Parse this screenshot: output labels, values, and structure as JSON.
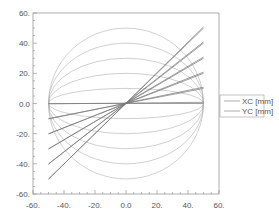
{
  "chart_data": {
    "type": "line",
    "title": "",
    "xlabel": "",
    "ylabel": "",
    "xlim": [
      -60,
      60
    ],
    "ylim": [
      -60,
      60
    ],
    "grid": false,
    "legend_position": "right",
    "x_ticks": [
      -60,
      -40,
      -20,
      0,
      20,
      40,
      60
    ],
    "x_tick_labels": [
      "-60.",
      "-40.",
      "-20.",
      "0.0",
      "20.",
      "40.",
      "60."
    ],
    "y_ticks": [
      60,
      40,
      20,
      0,
      -20,
      -40,
      -60
    ],
    "y_tick_labels": [
      "60.",
      "40.",
      "20.",
      "0.0",
      "-20.",
      "-40.",
      "-60."
    ],
    "legend": [
      {
        "name": "XC [mm]",
        "color": "#888888"
      },
      {
        "name": "YC [mm]",
        "color": "#888888"
      }
    ],
    "series": [
      {
        "name": "arc",
        "kind": "half-ellipse",
        "rx": 50,
        "ry": [
          50,
          40,
          30,
          20,
          10,
          -10,
          -20,
          -30,
          -40,
          -50
        ],
        "color": "#b0b0b0"
      },
      {
        "name": "line",
        "kind": "straight",
        "segments": [
          {
            "x": [
              -50,
              50
            ],
            "y": [
              0,
              0
            ]
          },
          {
            "x": [
              -50,
              50
            ],
            "y": [
              -10,
              10
            ]
          },
          {
            "x": [
              -50,
              50
            ],
            "y": [
              -20,
              20
            ]
          },
          {
            "x": [
              -50,
              50
            ],
            "y": [
              -30,
              30
            ]
          },
          {
            "x": [
              -50,
              50
            ],
            "y": [
              -40,
              40
            ]
          },
          {
            "x": [
              -50,
              50
            ],
            "y": [
              -50,
              50
            ]
          }
        ],
        "color": "#777777"
      }
    ]
  }
}
